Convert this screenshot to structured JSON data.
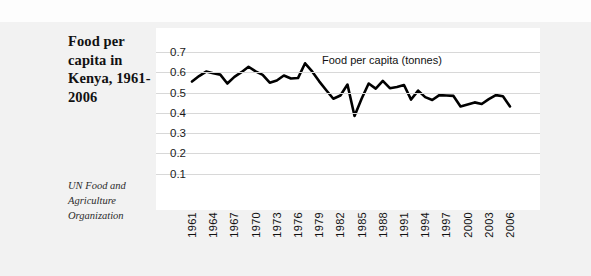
{
  "title": "Food per capita in Kenya, 1961-2006",
  "source_note": "UN Food and Agriculture Organization",
  "chart_data": {
    "type": "line",
    "title": "Food per capita in Kenya, 1961-2006",
    "xlabel": "",
    "ylabel": "",
    "ylim": [
      0,
      0.75
    ],
    "ytick_labels": [
      "0.7",
      "0.6",
      "0.5",
      "0.4",
      "0.3",
      "0.2",
      "0.1"
    ],
    "ytick_values": [
      0.7,
      0.6,
      0.5,
      0.4,
      0.3,
      0.2,
      0.1
    ],
    "grid": true,
    "legend_position": "inside-top-right",
    "series": [
      {
        "name": "Food per capita (tonnes)",
        "color": "#000000",
        "x": [
          1961,
          1962,
          1963,
          1964,
          1965,
          1966,
          1967,
          1968,
          1969,
          1970,
          1971,
          1972,
          1973,
          1974,
          1975,
          1976,
          1977,
          1978,
          1979,
          1980,
          1981,
          1982,
          1983,
          1984,
          1985,
          1986,
          1987,
          1988,
          1989,
          1990,
          1991,
          1992,
          1993,
          1994,
          1995,
          1996,
          1997,
          1998,
          1999,
          2000,
          2001,
          2002,
          2003,
          2004,
          2005,
          2006
        ],
        "values": [
          0.555,
          0.582,
          0.604,
          0.596,
          0.589,
          0.545,
          0.578,
          0.601,
          0.628,
          0.605,
          0.588,
          0.549,
          0.56,
          0.585,
          0.57,
          0.572,
          0.645,
          0.605,
          0.556,
          0.512,
          0.47,
          0.486,
          0.54,
          0.385,
          0.47,
          0.545,
          0.52,
          0.558,
          0.522,
          0.528,
          0.538,
          0.466,
          0.51,
          0.478,
          0.464,
          0.488,
          0.486,
          0.484,
          0.432,
          0.442,
          0.452,
          0.444,
          0.468,
          0.488,
          0.482,
          0.432
        ]
      }
    ],
    "xtick_labels": [
      "1961",
      "1964",
      "1967",
      "1970",
      "1973",
      "1976",
      "1979",
      "1982",
      "1985",
      "1988",
      "1991",
      "1994",
      "1997",
      "2000",
      "2003",
      "2006"
    ],
    "xtick_values": [
      1961,
      1964,
      1967,
      1970,
      1973,
      1976,
      1979,
      1982,
      1985,
      1988,
      1991,
      1994,
      1997,
      2000,
      2003,
      2006
    ]
  }
}
